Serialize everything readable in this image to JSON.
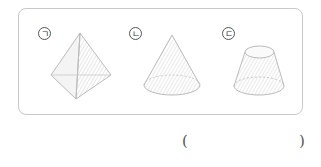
{
  "figures": [
    {
      "label": "ㄱ",
      "shape": "triangular-pyramid"
    },
    {
      "label": "ㄴ",
      "shape": "cone"
    },
    {
      "label": "ㄷ",
      "shape": "truncated-cone"
    }
  ],
  "answer": {
    "open": "(",
    "close": ")",
    "value": ""
  }
}
